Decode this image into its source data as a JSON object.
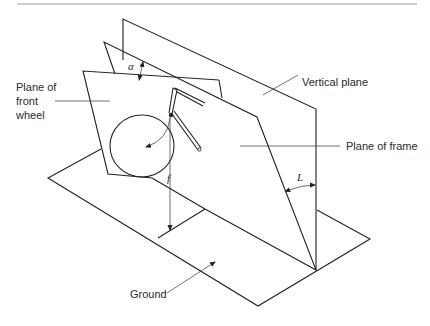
{
  "figure": {
    "labels": {
      "front_wheel_plane": [
        "Plane of",
        "front",
        "wheel"
      ],
      "vertical_plane": "Vertical plane",
      "frame_plane": "Plane of frame",
      "ground": "Ground"
    },
    "symbols": {
      "alpha": "α",
      "trail": "f",
      "lean": "L"
    },
    "colors": {
      "line": "#222222",
      "text": "#2a2a2a",
      "background": "#ffffff",
      "top_rule": "#999999"
    }
  }
}
